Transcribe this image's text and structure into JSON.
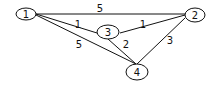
{
  "graph": {
    "type": "weighted-undirected-graph",
    "nodes": [
      {
        "id": "1",
        "label": "1"
      },
      {
        "id": "2",
        "label": "2"
      },
      {
        "id": "3",
        "label": "3"
      },
      {
        "id": "4",
        "label": "4"
      }
    ],
    "edges": [
      {
        "from": "1",
        "to": "2",
        "weight": "5"
      },
      {
        "from": "1",
        "to": "3",
        "weight": "1"
      },
      {
        "from": "1",
        "to": "4",
        "weight": "5"
      },
      {
        "from": "3",
        "to": "2",
        "weight": "1"
      },
      {
        "from": "3",
        "to": "4",
        "weight": "2"
      },
      {
        "from": "2",
        "to": "4",
        "weight": "3"
      }
    ]
  }
}
